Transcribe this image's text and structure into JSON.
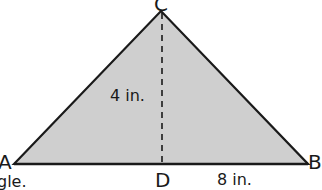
{
  "diagram": {
    "shape": "triangle",
    "fill_color": "#cfcfcf",
    "stroke_color": "#1a1a1a",
    "vertices": {
      "A": {
        "label": "A"
      },
      "B": {
        "label": "B"
      },
      "C": {
        "label": "C"
      },
      "D": {
        "label": "D"
      }
    },
    "height_label": "4 in.",
    "segment_DB_label": "8 in.",
    "altitude": "CD (dashed)",
    "partial_text": "gle."
  }
}
